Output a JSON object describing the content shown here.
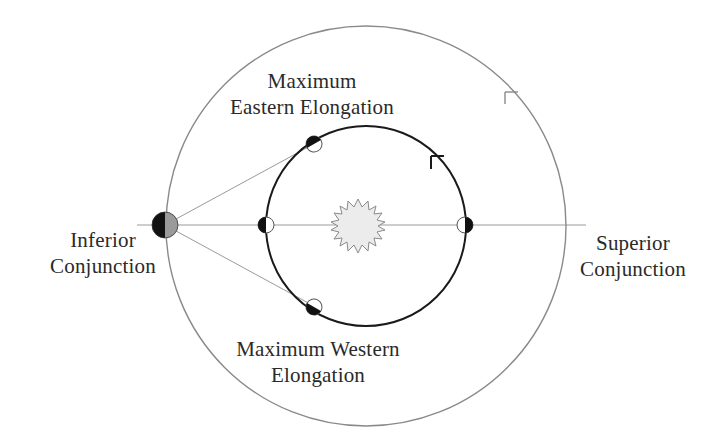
{
  "diagram": {
    "labels": {
      "max_eastern": {
        "line1": "Maximum",
        "line2": "Eastern Elongation"
      },
      "max_western": {
        "line1": "Maximum Western",
        "line2": "Elongation"
      },
      "inferior": {
        "line1": "Inferior",
        "line2": "Conjunction"
      },
      "superior": {
        "line1": "Superior",
        "line2": "Conjunction"
      }
    },
    "objects": {
      "sun": "sun (center)",
      "earth": "Earth on outer orbit",
      "outer_orbit": "Earth's orbit",
      "inner_orbit": "inferior planet's orbit",
      "planets": [
        "planet at maximum eastern elongation",
        "planet at inferior conjunction",
        "planet at superior conjunction",
        "planet at maximum western elongation"
      ]
    },
    "colors": {
      "outer_orbit": "#8a8a8a",
      "inner_orbit": "#1a1a1a",
      "sight_lines": "#9a9a9a",
      "sun_fill": "#ececec",
      "sun_stroke": "#8a8a8a",
      "planet_dark": "#111111",
      "earth_light": "#9a9a9a",
      "text": "#2a2a2a"
    }
  }
}
